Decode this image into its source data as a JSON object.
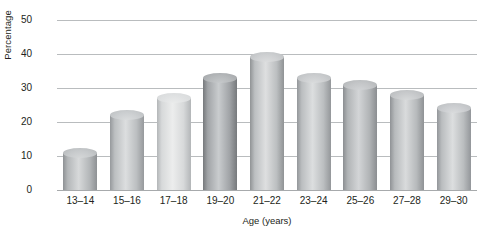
{
  "chart_data": {
    "type": "bar",
    "title": "",
    "subtitle": "",
    "xlabel": "Age (years)",
    "ylabel": "Percentage",
    "categories": [
      "13–14",
      "15–16",
      "17–18",
      "19–20",
      "21–22",
      "23–24",
      "25–26",
      "27–28",
      "29–30"
    ],
    "values": [
      11,
      22,
      27,
      33,
      39,
      33,
      31,
      28,
      24
    ],
    "ylim": [
      0,
      50
    ],
    "yticks": [
      0,
      10,
      20,
      30,
      40,
      50
    ],
    "ytick_labels": [
      "0",
      "10",
      "20",
      "30",
      "40",
      "50"
    ],
    "grid": true,
    "legend": "none",
    "bar_style": "cylinder",
    "bar_colors": [
      {
        "light": "#d7d9da",
        "mid": "#b4b7b9",
        "dark": "#8e9194",
        "top": "#c6c9cb"
      },
      {
        "light": "#dcdedf",
        "mid": "#bcbfc1",
        "dark": "#96999c",
        "top": "#cbced0"
      },
      {
        "light": "#eceded",
        "mid": "#d7d9da",
        "dark": "#b3b6b8",
        "top": "#dfe1e2"
      },
      {
        "light": "#c9ccce",
        "mid": "#a1a4a7",
        "dark": "#76797c",
        "top": "#b5b8ba"
      },
      {
        "light": "#dedfe0",
        "mid": "#bcbfc1",
        "dark": "#909395",
        "top": "#cdcfd1"
      },
      {
        "light": "#dcdedf",
        "mid": "#bbbec0",
        "dark": "#94979a",
        "top": "#cbcdcf"
      },
      {
        "light": "#d3d5d7",
        "mid": "#b1b4b6",
        "dark": "#8b8e91",
        "top": "#c3c5c7"
      },
      {
        "light": "#d9dbdc",
        "mid": "#b7babc",
        "dark": "#8f9295",
        "top": "#c7c9cb"
      },
      {
        "light": "#dcdedf",
        "mid": "#babdbf",
        "dark": "#93969a",
        "top": "#cacccf"
      }
    ],
    "axis_color": "#b9bcbe",
    "text_color": "#231f20",
    "background": "#ffffff"
  }
}
